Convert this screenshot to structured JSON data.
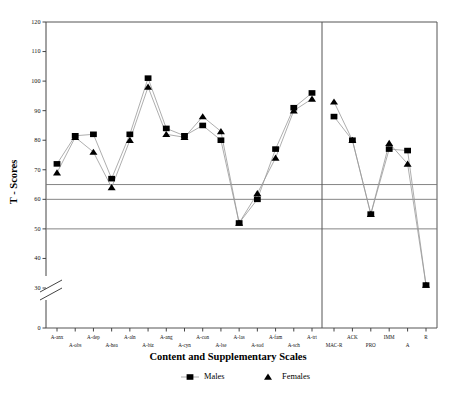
{
  "chart_data": {
    "type": "line",
    "title": "",
    "xlabel": "Content and Supplementary Scales",
    "ylabel": "T - Scores",
    "ylim": [
      0,
      120
    ],
    "yticks": [
      0,
      30,
      40,
      50,
      60,
      70,
      80,
      90,
      100,
      110,
      120
    ],
    "axis_break": true,
    "axis_break_between": [
      0,
      30
    ],
    "grid": false,
    "reference_lines": [
      65,
      60,
      50
    ],
    "group_separator_after": "A-trt",
    "legend_position": "bottom",
    "categories": [
      "A-anx",
      "A-obs",
      "A-dep",
      "A-hea",
      "A-aln",
      "A-biz",
      "A-ang",
      "A-cyn",
      "A-con",
      "A-lse",
      "A-las",
      "A-sod",
      "A-fam",
      "A-sch",
      "A-trt",
      "MAC-R",
      "ACK",
      "PRO",
      "IMM",
      "A",
      "R"
    ],
    "series": [
      {
        "name": "Males",
        "marker": "square",
        "values": [
          72,
          81.5,
          82,
          67,
          82,
          101,
          84,
          81.5,
          85,
          80,
          52,
          60,
          77,
          91,
          96,
          88,
          80,
          55,
          77,
          76.5,
          31
        ]
      },
      {
        "name": "Females",
        "marker": "triangle",
        "values": [
          69,
          81,
          76,
          64,
          80,
          98,
          82,
          81,
          88,
          83,
          52,
          62,
          74,
          90,
          94,
          93,
          80,
          55,
          79,
          72,
          31
        ]
      }
    ]
  },
  "legend": {
    "items": [
      {
        "label": "Males",
        "marker": "square"
      },
      {
        "label": "Females",
        "marker": "triangle"
      }
    ]
  },
  "colors": {
    "marker": "#000000",
    "line": "#999999",
    "axis": "#444444",
    "reference_line": "#777777"
  }
}
